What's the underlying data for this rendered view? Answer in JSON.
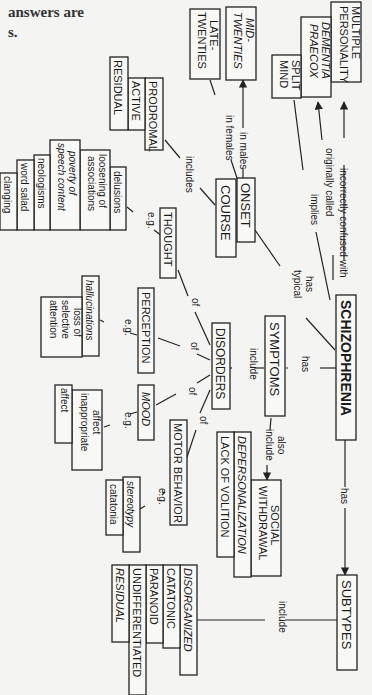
{
  "header_fragment": {
    "line1": "answers are",
    "line2": "s."
  },
  "concept_map": {
    "orientation": "rotated 90 degrees clockwise",
    "central": "SCHIZOPHRENIA",
    "nodes": {
      "schizophrenia": "SCHIZOPHRENIA",
      "multiple_personality": [
        "MULTIPLE",
        "PERSONALITY"
      ],
      "dementia_praecox": [
        "DEMENTIA",
        "PRAECOX"
      ],
      "split_mind": [
        "SPLIT",
        "MIND"
      ],
      "mid_twenties": [
        "MID-",
        "TWENTIES"
      ],
      "late_twenties": [
        "LATE-",
        "TWENTIES"
      ],
      "onset": "ONSET",
      "course": "COURSE",
      "prodromal": "PRODROMAL",
      "active": "ACTIVE",
      "residual_phase": "RESIDUAL",
      "symptoms": "SYMPTOMS",
      "disorders": "DISORDERS",
      "thought": "THOUGHT",
      "perception": "PERCEPTION",
      "mood": "MOOD",
      "motor_behavior": "MOTOR BEHAVIOR",
      "social_withdrawal": [
        "SOCIAL",
        "WITHDRAWAL"
      ],
      "depersonalization": "DEPERSONALIZATION",
      "lack_of_volition": "LACK OF VOLITION",
      "subtypes": "SUBTYPES",
      "thought_examples": [
        "delusions",
        "loosening of associations",
        "poverty of speech content",
        "neologisms",
        "word salad",
        "clanging"
      ],
      "perception_examples": [
        "hallucinations",
        "loss of selective attention"
      ],
      "mood_examples": [
        "affect inappropriate",
        "affect blunted"
      ],
      "motor_examples": [
        "stereotypy",
        "catatonia"
      ],
      "subtype_list": [
        "DISORGANIZED",
        "CATATONIC",
        "PARANOID",
        "UNDIFFERENTIATED",
        "RESIDUAL"
      ]
    },
    "links": {
      "incorrectly_confused_with": "incorrectly confused with",
      "originally_called": "originally called",
      "implies": "implies",
      "has_typical": [
        "has",
        "typical"
      ],
      "in_males": "in males",
      "in_females": "in females",
      "includes": "includes",
      "has_symptoms": "has",
      "has_subtypes": "has",
      "include_disorders": "include",
      "also_include": [
        "also",
        "include"
      ],
      "include_subtypes": "include",
      "of": "of",
      "eg": "e.g."
    }
  }
}
